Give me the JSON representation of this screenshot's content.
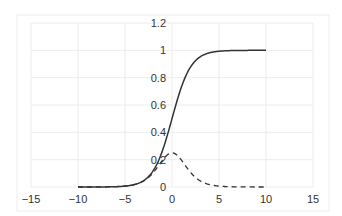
{
  "chart_data": {
    "type": "line",
    "title": "",
    "xlabel": "",
    "ylabel": "",
    "xlim": [
      -15,
      15
    ],
    "ylim": [
      0,
      1.2
    ],
    "x_ticks": [
      -15,
      -10,
      -5,
      0,
      5,
      10,
      15
    ],
    "x_tick_labels": [
      "−15",
      "−10",
      "−5",
      "0",
      "5",
      "10",
      "15"
    ],
    "y_ticks": [
      0,
      0.2,
      0.4,
      0.6,
      0.8,
      1,
      1.2
    ],
    "y_tick_labels": [
      "0",
      "0.2",
      "0.4",
      "0.6",
      "0.8",
      "1",
      "1.2"
    ],
    "grid": true,
    "legend": null,
    "axes_origin": "centered at x=0",
    "series": [
      {
        "name": "sigmoid",
        "style": "solid",
        "color": "#333333",
        "x": [
          -10,
          -8,
          -6,
          -5,
          -4,
          -3,
          -2,
          -1,
          0,
          1,
          2,
          3,
          4,
          5,
          6,
          8,
          10
        ],
        "values": [
          4.54e-05,
          0.000335,
          0.00247,
          0.00669,
          0.018,
          0.0474,
          0.1192,
          0.2689,
          0.5,
          0.7311,
          0.8808,
          0.9526,
          0.982,
          0.9933,
          0.9975,
          0.9997,
          0.99995
        ]
      },
      {
        "name": "sigmoid derivative",
        "style": "dashed",
        "color": "#333333",
        "x": [
          -10,
          -8,
          -6,
          -5,
          -4,
          -3,
          -2,
          -1,
          0,
          1,
          2,
          3,
          4,
          5,
          6,
          8,
          10
        ],
        "values": [
          4.54e-05,
          0.000335,
          0.00247,
          0.00665,
          0.0177,
          0.0452,
          0.105,
          0.1966,
          0.25,
          0.1966,
          0.105,
          0.0452,
          0.0177,
          0.00665,
          0.00247,
          0.000335,
          4.54e-05
        ]
      }
    ]
  }
}
